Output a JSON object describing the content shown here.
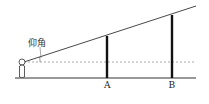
{
  "diagram": {
    "angle_label": "仰角",
    "points": [
      {
        "label": "A"
      },
      {
        "label": "B"
      }
    ],
    "colors": {
      "line": "#333333",
      "pole": "#111111",
      "dashed": "#888888",
      "background": "#ffffff"
    }
  }
}
